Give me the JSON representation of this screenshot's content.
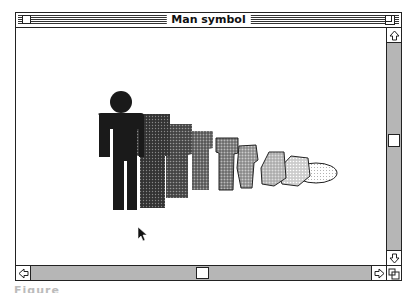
{
  "window": {
    "title": "Man symbol",
    "controls": {
      "close_box": "close-box",
      "zoom_box": "zoom-box",
      "grow_box": "grow-box"
    }
  },
  "content": {
    "description": "Sequence of man silhouettes progressively falling/collapsing into an oval, rendered with decreasing dither density",
    "figures_count": 9,
    "fill_colors": [
      "#1a1a1a",
      "#333333",
      "#4a4a4a",
      "#5e5e5e",
      "#707070",
      "#858585",
      "#9a9a9a",
      "#b0b0b0",
      "#c8c8c8"
    ]
  },
  "scrollbars": {
    "vertical": {
      "up_icon": "arrow-up-icon",
      "down_icon": "arrow-down-icon",
      "thumb_position": 0.5
    },
    "horizontal": {
      "left_icon": "arrow-left-icon",
      "right_icon": "arrow-right-icon",
      "thumb_position": 0.5
    }
  },
  "caption": "Figure"
}
